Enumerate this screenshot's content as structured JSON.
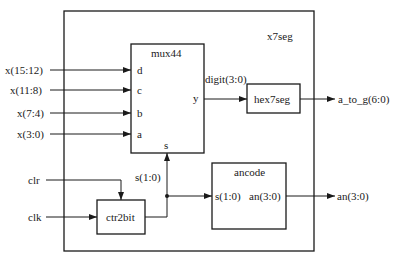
{
  "diagram": {
    "title": "x7seg",
    "blocks": {
      "mux44": {
        "label": "mux44",
        "ports": {
          "d": "d",
          "c": "c",
          "b": "b",
          "a": "a",
          "y": "y",
          "s": "s"
        }
      },
      "hex7seg": {
        "label": "hex7seg"
      },
      "ancode": {
        "label": "ancode",
        "ports": {
          "in": "s(1:0)",
          "out": "an(3:0)"
        }
      },
      "ctr2bit": {
        "label": "ctr2bit"
      }
    },
    "inputs": {
      "x_15_12": "x(15:12)",
      "x_11_8": "x(11:8)",
      "x_7_4": "x(7:4)",
      "x_3_0": "x(3:0)",
      "clr": "clr",
      "clk": "clk"
    },
    "outputs": {
      "a_to_g": "a_to_g(6:0)",
      "an": "an(3:0)"
    },
    "signals": {
      "digit": "digit(3:0)",
      "s": "s(1:0)"
    }
  }
}
